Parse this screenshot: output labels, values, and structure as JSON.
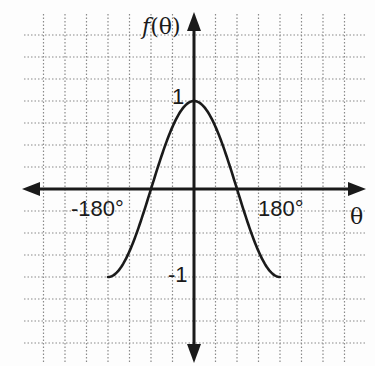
{
  "chart_data": {
    "type": "line",
    "title": "",
    "xlabel": "θ",
    "ylabel": "f(θ)",
    "function": "cos(θ)",
    "x_unit": "degrees",
    "xlim": [
      -180,
      180
    ],
    "ylim": [
      -1,
      1
    ],
    "x_tick_labels": [
      "-180°",
      "180°"
    ],
    "y_tick_labels": [
      "1",
      "-1"
    ],
    "grid": true,
    "grid_step_x_deg": 45,
    "grid_step_y": 0.25,
    "legend": null,
    "series": [
      {
        "name": "f(θ)",
        "x": [
          -180,
          -135,
          -90,
          -45,
          0,
          45,
          90,
          135,
          180
        ],
        "y": [
          -1,
          -0.707,
          0,
          0.707,
          1,
          0.707,
          0,
          -0.707,
          -1
        ]
      }
    ]
  },
  "labels": {
    "y_axis": "f(θ)",
    "x_axis": "θ",
    "y_max": "1",
    "y_min": "-1",
    "x_min": "-180°",
    "x_max": "180°"
  },
  "colors": {
    "axis": "#1a1a1a",
    "curve": "#1a1a1a",
    "grid": "#8a8a8a",
    "background": "#fdfdfd"
  }
}
